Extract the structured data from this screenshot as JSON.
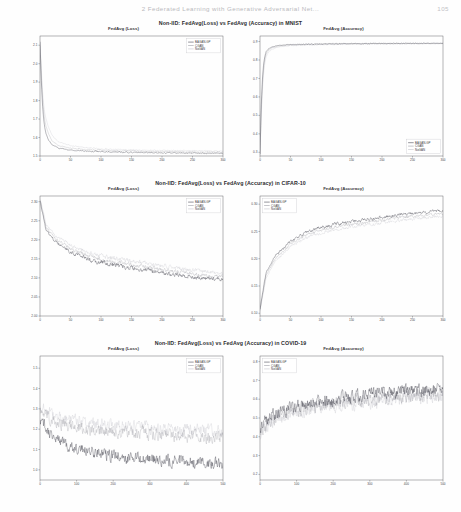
{
  "header": {
    "running_title": "2  Federated Learning with Generative Adversarial Net...",
    "page_number": "105"
  },
  "figures": [
    {
      "id": "mnist",
      "caption": "Non-IID: FedAvg(Loss) vs FedAvg (Accuracy) in MNIST",
      "panels": [
        "loss-mnist",
        "accuracy-mnist"
      ]
    },
    {
      "id": "cifar10",
      "caption": "Non-IID: FedAvg(Loss) vs FedAvg (Accuracy) in CIFAR-10",
      "panels": [
        "loss-cifar10",
        "accuracy-cifar10"
      ]
    },
    {
      "id": "covid19",
      "caption": "Non-IID: FedAvg(Loss) vs FedAvg (Accuracy) in COVID-19",
      "panels": [
        "loss-covid19",
        "accuracy-covid19"
      ]
    }
  ],
  "legend_labels": [
    "BAGAN-GP",
    "CGAN",
    "NoGAN"
  ],
  "colors": {
    "bagan_gp": "#2b2b38",
    "cgan": "#8d8d97",
    "nogan": "#b9b9c2",
    "axis": "#5a5a5e",
    "caption": "#2b2b2e"
  },
  "chart_data": [
    {
      "type": "line",
      "id": "loss-mnist",
      "title": "FedAvg (Loss)",
      "xlabel": "",
      "ylabel": "",
      "xlim": [
        0,
        300
      ],
      "ylim": [
        1.5,
        2.15
      ],
      "xticks": [
        0,
        50,
        100,
        150,
        200,
        250,
        300
      ],
      "xticklabels": [
        "0",
        "50",
        "100",
        "150",
        "200",
        "250",
        "300"
      ],
      "yticks": [
        1.5,
        1.6,
        1.7,
        1.8,
        1.9,
        2.0,
        2.1
      ],
      "yticklabels": [
        "1.5",
        "1.6",
        "1.7",
        "1.8",
        "1.9",
        "2.0",
        "2.1"
      ],
      "grid": false,
      "legend_position": "upper right",
      "noise": 0.006,
      "seed": 11,
      "series": [
        {
          "name": "BAGAN-GP",
          "color": "#2b2b38",
          "shape": "decay",
          "y0": 2.12,
          "yinf": 1.513,
          "k": 0.22,
          "x": [
            0,
            2,
            4,
            6,
            8,
            10,
            14,
            20,
            30,
            50,
            80,
            120,
            180,
            240,
            300
          ],
          "values": [
            2.12,
            1.92,
            1.78,
            1.7,
            1.65,
            1.62,
            1.585,
            1.56,
            1.543,
            1.532,
            1.526,
            1.521,
            1.518,
            1.516,
            1.514
          ]
        },
        {
          "name": "CGAN",
          "color": "#8d8d97",
          "shape": "decay",
          "y0": 2.1,
          "yinf": 1.52,
          "k": 0.2,
          "x": [
            0,
            2,
            4,
            6,
            8,
            10,
            14,
            20,
            30,
            50,
            80,
            120,
            180,
            240,
            300
          ],
          "values": [
            2.1,
            1.95,
            1.82,
            1.74,
            1.69,
            1.66,
            1.62,
            1.58,
            1.557,
            1.543,
            1.534,
            1.529,
            1.525,
            1.523,
            1.521
          ]
        },
        {
          "name": "NoGAN",
          "color": "#b9b9c2",
          "shape": "decay",
          "y0": 2.115,
          "yinf": 1.527,
          "k": 0.18,
          "x": [
            0,
            2,
            4,
            6,
            8,
            10,
            14,
            20,
            30,
            50,
            80,
            120,
            180,
            240,
            300
          ],
          "values": [
            2.115,
            1.98,
            1.86,
            1.78,
            1.73,
            1.7,
            1.655,
            1.61,
            1.578,
            1.556,
            1.543,
            1.536,
            1.531,
            1.529,
            1.527
          ]
        }
      ]
    },
    {
      "type": "line",
      "id": "accuracy-mnist",
      "title": "FedAvg (Accuracy)",
      "xlabel": "",
      "ylabel": "",
      "xlim": [
        0,
        300
      ],
      "ylim": [
        0.28,
        0.93
      ],
      "xticks": [
        0,
        50,
        100,
        150,
        200,
        250,
        300
      ],
      "xticklabels": [
        "0",
        "50",
        "100",
        "150",
        "200",
        "250",
        "300"
      ],
      "yticks": [
        0.3,
        0.4,
        0.5,
        0.6,
        0.7,
        0.8,
        0.9
      ],
      "yticklabels": [
        "0.3",
        "0.4",
        "0.5",
        "0.6",
        "0.7",
        "0.8",
        "0.9"
      ],
      "grid": false,
      "legend_position": "lower right",
      "noise": 0.004,
      "seed": 23,
      "series": [
        {
          "name": "BAGAN-GP",
          "color": "#2b2b38",
          "shape": "rise",
          "x": [
            0,
            2,
            4,
            6,
            8,
            10,
            14,
            20,
            30,
            50,
            80,
            120,
            180,
            240,
            300
          ],
          "values": [
            0.29,
            0.55,
            0.7,
            0.78,
            0.82,
            0.845,
            0.862,
            0.872,
            0.879,
            0.884,
            0.886,
            0.888,
            0.889,
            0.89,
            0.891
          ]
        },
        {
          "name": "CGAN",
          "color": "#8d8d97",
          "shape": "rise",
          "x": [
            0,
            2,
            4,
            6,
            8,
            10,
            14,
            20,
            30,
            50,
            80,
            120,
            180,
            240,
            300
          ],
          "values": [
            0.29,
            0.52,
            0.67,
            0.76,
            0.805,
            0.833,
            0.853,
            0.866,
            0.875,
            0.881,
            0.884,
            0.886,
            0.888,
            0.889,
            0.89
          ]
        },
        {
          "name": "NoGAN",
          "color": "#b9b9c2",
          "shape": "rise",
          "x": [
            0,
            2,
            4,
            6,
            8,
            10,
            14,
            20,
            30,
            50,
            80,
            120,
            180,
            240,
            300
          ],
          "values": [
            0.29,
            0.5,
            0.64,
            0.73,
            0.785,
            0.818,
            0.843,
            0.859,
            0.87,
            0.878,
            0.882,
            0.885,
            0.887,
            0.888,
            0.889
          ]
        }
      ]
    },
    {
      "type": "line",
      "id": "loss-cifar10",
      "title": "FedAvg (Loss)",
      "xlabel": "",
      "ylabel": "",
      "xlim": [
        0,
        300
      ],
      "ylim": [
        2.0,
        2.315
      ],
      "xticks": [
        0,
        50,
        100,
        150,
        200,
        250,
        300
      ],
      "xticklabels": [
        "0",
        "50",
        "100",
        "150",
        "200",
        "250",
        "300"
      ],
      "yticks": [
        2.0,
        2.05,
        2.1,
        2.15,
        2.2,
        2.25,
        2.3
      ],
      "yticklabels": [
        "2.00",
        "2.05",
        "2.10",
        "2.15",
        "2.20",
        "2.25",
        "2.30"
      ],
      "grid": false,
      "legend_position": "upper right",
      "noise": 0.022,
      "seed": 7,
      "series": [
        {
          "name": "BAGAN-GP",
          "color": "#2b2b38",
          "shape": "decay",
          "x": [
            0,
            10,
            25,
            50,
            75,
            100,
            125,
            150,
            175,
            200,
            225,
            250,
            275,
            300
          ],
          "values": [
            2.305,
            2.225,
            2.195,
            2.168,
            2.152,
            2.14,
            2.132,
            2.126,
            2.12,
            2.114,
            2.108,
            2.102,
            2.098,
            2.095
          ]
        },
        {
          "name": "CGAN",
          "color": "#8d8d97",
          "shape": "decay",
          "x": [
            0,
            10,
            25,
            50,
            75,
            100,
            125,
            150,
            175,
            200,
            225,
            250,
            275,
            300
          ],
          "values": [
            2.3,
            2.232,
            2.203,
            2.176,
            2.16,
            2.148,
            2.14,
            2.134,
            2.128,
            2.122,
            2.116,
            2.11,
            2.106,
            2.103
          ]
        },
        {
          "name": "NoGAN",
          "color": "#b9b9c2",
          "shape": "decay",
          "x": [
            0,
            10,
            25,
            50,
            75,
            100,
            125,
            150,
            175,
            200,
            225,
            250,
            275,
            300
          ],
          "values": [
            2.31,
            2.24,
            2.212,
            2.186,
            2.17,
            2.158,
            2.15,
            2.144,
            2.138,
            2.132,
            2.126,
            2.12,
            2.116,
            2.113
          ]
        }
      ]
    },
    {
      "type": "line",
      "id": "accuracy-cifar10",
      "title": "FedAvg (Accuracy)",
      "xlabel": "",
      "ylabel": "",
      "xlim": [
        0,
        300
      ],
      "ylim": [
        0.095,
        0.315
      ],
      "xticks": [
        0,
        50,
        100,
        150,
        200,
        250,
        300
      ],
      "xticklabels": [
        "0",
        "50",
        "100",
        "150",
        "200",
        "250",
        "300"
      ],
      "yticks": [
        0.1,
        0.15,
        0.2,
        0.25,
        0.3
      ],
      "yticklabels": [
        "0.10",
        "0.15",
        "0.20",
        "0.25",
        "0.30"
      ],
      "grid": false,
      "legend_position": "upper left",
      "noise": 0.016,
      "seed": 31,
      "series": [
        {
          "name": "BAGAN-GP",
          "color": "#2b2b38",
          "shape": "rise",
          "x": [
            0,
            10,
            25,
            50,
            75,
            100,
            125,
            150,
            175,
            200,
            225,
            250,
            275,
            300
          ],
          "values": [
            0.108,
            0.175,
            0.205,
            0.232,
            0.248,
            0.258,
            0.264,
            0.268,
            0.272,
            0.276,
            0.28,
            0.283,
            0.286,
            0.288
          ]
        },
        {
          "name": "CGAN",
          "color": "#8d8d97",
          "shape": "rise",
          "x": [
            0,
            10,
            25,
            50,
            75,
            100,
            125,
            150,
            175,
            200,
            225,
            250,
            275,
            300
          ],
          "values": [
            0.106,
            0.17,
            0.2,
            0.227,
            0.243,
            0.253,
            0.259,
            0.263,
            0.267,
            0.271,
            0.275,
            0.278,
            0.281,
            0.283
          ]
        },
        {
          "name": "NoGAN",
          "color": "#b9b9c2",
          "shape": "rise",
          "x": [
            0,
            10,
            25,
            50,
            75,
            100,
            125,
            150,
            175,
            200,
            225,
            250,
            275,
            300
          ],
          "values": [
            0.104,
            0.165,
            0.195,
            0.222,
            0.238,
            0.248,
            0.254,
            0.258,
            0.262,
            0.266,
            0.27,
            0.273,
            0.276,
            0.278
          ]
        }
      ]
    },
    {
      "type": "line",
      "id": "loss-covid19",
      "title": "FedAvg (Loss)",
      "xlabel": "",
      "ylabel": "",
      "xlim": [
        0,
        500
      ],
      "ylim": [
        0.95,
        1.56
      ],
      "xticks": [
        0,
        100,
        200,
        300,
        400,
        500
      ],
      "xticklabels": [
        "0",
        "100",
        "200",
        "300",
        "400",
        "500"
      ],
      "yticks": [
        1.0,
        1.1,
        1.2,
        1.3,
        1.4,
        1.5
      ],
      "yticklabels": [
        "1.0",
        "1.1",
        "1.2",
        "1.3",
        "1.4",
        "1.5"
      ],
      "grid": false,
      "legend_position": "upper right",
      "noise": 0.075,
      "seed": 47,
      "series": [
        {
          "name": "BAGAN-GP",
          "color": "#2b2b38",
          "shape": "decay",
          "x": [
            0,
            25,
            50,
            100,
            150,
            200,
            250,
            300,
            350,
            400,
            450,
            500
          ],
          "values": [
            1.255,
            1.185,
            1.14,
            1.105,
            1.085,
            1.07,
            1.06,
            1.052,
            1.046,
            1.04,
            1.035,
            1.03
          ]
        },
        {
          "name": "CGAN",
          "color": "#8d8d97",
          "shape": "decay",
          "x": [
            0,
            25,
            50,
            100,
            150,
            200,
            250,
            300,
            350,
            400,
            450,
            500
          ],
          "values": [
            1.3,
            1.255,
            1.23,
            1.208,
            1.196,
            1.188,
            1.182,
            1.176,
            1.17,
            1.165,
            1.16,
            1.156
          ]
        },
        {
          "name": "NoGAN",
          "color": "#b9b9c2",
          "shape": "decay",
          "x": [
            0,
            25,
            50,
            100,
            150,
            200,
            250,
            300,
            350,
            400,
            450,
            500
          ],
          "values": [
            1.32,
            1.28,
            1.258,
            1.238,
            1.226,
            1.218,
            1.212,
            1.206,
            1.2,
            1.195,
            1.19,
            1.186
          ]
        }
      ]
    },
    {
      "type": "line",
      "id": "accuracy-covid19",
      "title": "FedAvg (Accuracy)",
      "xlabel": "",
      "ylabel": "",
      "xlim": [
        0,
        500
      ],
      "ylim": [
        0.17,
        0.83
      ],
      "xticks": [
        0,
        100,
        200,
        300,
        400,
        500
      ],
      "xticklabels": [
        "0",
        "100",
        "200",
        "300",
        "400",
        "500"
      ],
      "yticks": [
        0.2,
        0.3,
        0.4,
        0.5,
        0.6,
        0.7,
        0.8
      ],
      "yticklabels": [
        "0.2",
        "0.3",
        "0.4",
        "0.5",
        "0.6",
        "0.7",
        "0.8"
      ],
      "grid": false,
      "legend_position": "upper left",
      "noise": 0.082,
      "seed": 59,
      "series": [
        {
          "name": "BAGAN-GP",
          "color": "#2b2b38",
          "shape": "rise",
          "x": [
            0,
            25,
            50,
            100,
            150,
            200,
            250,
            300,
            350,
            400,
            450,
            500
          ],
          "values": [
            0.455,
            0.505,
            0.535,
            0.565,
            0.585,
            0.6,
            0.612,
            0.622,
            0.63,
            0.638,
            0.645,
            0.65
          ]
        },
        {
          "name": "CGAN",
          "color": "#8d8d97",
          "shape": "rise",
          "x": [
            0,
            25,
            50,
            100,
            150,
            200,
            250,
            300,
            350,
            400,
            450,
            500
          ],
          "values": [
            0.43,
            0.48,
            0.51,
            0.543,
            0.563,
            0.578,
            0.59,
            0.6,
            0.609,
            0.617,
            0.624,
            0.63
          ]
        },
        {
          "name": "NoGAN",
          "color": "#b9b9c2",
          "shape": "rise",
          "x": [
            0,
            25,
            50,
            100,
            150,
            200,
            250,
            300,
            350,
            400,
            450,
            500
          ],
          "values": [
            0.415,
            0.465,
            0.495,
            0.528,
            0.548,
            0.563,
            0.575,
            0.585,
            0.594,
            0.602,
            0.609,
            0.615
          ]
        }
      ]
    }
  ]
}
